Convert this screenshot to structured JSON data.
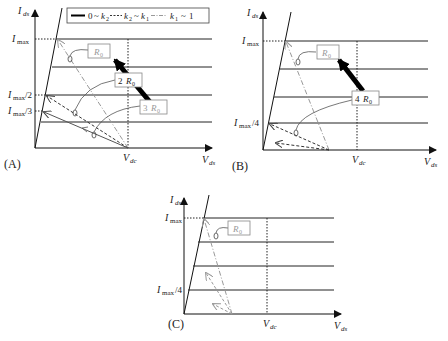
{
  "legend": {
    "solid": "0 ~ k2",
    "dashed": "k2 ~ k1",
    "dashdot": "k1 ~ 1",
    "solid_sym": "0",
    "k2": "k",
    "k2_sub": "2",
    "k1": "k",
    "k1_sub": "1",
    "one": "1",
    "tilde": "~"
  },
  "axes": {
    "y_label": "I",
    "y_sub": "ds",
    "x_label": "V",
    "x_sub": "ds",
    "vdc": "V",
    "vdc_sub": "dc",
    "imax": "I",
    "imax_sub": "max"
  },
  "panels": [
    {
      "id": "A",
      "caption": "(A)",
      "ticks": [
        {
          "label_sub": "max",
          "suffix": ""
        },
        {
          "label_sub": "max",
          "suffix": "/2"
        },
        {
          "label_sub": "max",
          "suffix": "/3"
        }
      ],
      "loads": [
        "R0",
        "2 R0",
        "3 R0"
      ]
    },
    {
      "id": "B",
      "caption": "(B)",
      "ticks": [
        {
          "label_sub": "max",
          "suffix": ""
        },
        {
          "label_sub": "max",
          "suffix": "/4"
        }
      ],
      "loads": [
        "R0",
        "4 R0"
      ]
    },
    {
      "id": "C",
      "caption": "(C)",
      "ticks": [
        {
          "label_sub": "max",
          "suffix": ""
        },
        {
          "label_sub": "max",
          "suffix": "/4"
        }
      ],
      "loads": [
        "R0"
      ]
    }
  ],
  "load_labels": {
    "r0_main": "R",
    "r0_sub": "0",
    "two": "2",
    "three": "3",
    "four": "4"
  }
}
